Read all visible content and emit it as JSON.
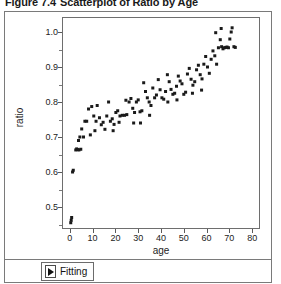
{
  "caption": {
    "number": "Figure 7.4",
    "text": "Scatterplot of Ratio by Age"
  },
  "bottom_bar": {
    "fitting_label": "Fitting",
    "expander_icon": "triangle-right-icon"
  },
  "chart_data": {
    "type": "scatter",
    "title": "Scatterplot of Ratio by Age",
    "xlabel": "age",
    "ylabel": "ratio",
    "xlim": [
      -3,
      83
    ],
    "ylim": [
      0.44,
      1.04
    ],
    "xticks": [
      0,
      10,
      20,
      30,
      40,
      50,
      60,
      70,
      80
    ],
    "xtick_labels": [
      "0",
      "10",
      "20",
      "30",
      "40",
      "50",
      "60",
      "70",
      "80"
    ],
    "yticks": [
      0.5,
      0.6,
      0.7,
      0.8,
      0.9,
      1.0
    ],
    "ytick_labels": [
      "0.5",
      "0.6",
      "0.7",
      "0.8",
      "0.9",
      "1.0"
    ],
    "grid": false,
    "legend": false,
    "marker": "square",
    "marker_color": "#1a1a1a",
    "marker_size": 3,
    "points": [
      [
        0.4,
        0.455
      ],
      [
        0.6,
        0.462
      ],
      [
        0.8,
        0.47
      ],
      [
        1.2,
        0.6
      ],
      [
        1.5,
        0.605
      ],
      [
        2.6,
        0.663
      ],
      [
        3.0,
        0.666
      ],
      [
        3.4,
        0.664
      ],
      [
        3.8,
        0.69
      ],
      [
        4.4,
        0.7
      ],
      [
        5.2,
        0.723
      ],
      [
        6.6,
        0.745
      ],
      [
        8.2,
        0.78
      ],
      [
        9.6,
        0.787
      ],
      [
        4.0,
        0.663
      ],
      [
        4.8,
        0.665
      ],
      [
        10.5,
        0.76
      ],
      [
        11.5,
        0.745
      ],
      [
        12.0,
        0.79
      ],
      [
        13.0,
        0.755
      ],
      [
        13.8,
        0.735
      ],
      [
        14.6,
        0.742
      ],
      [
        15.4,
        0.722
      ],
      [
        16.2,
        0.76
      ],
      [
        17.0,
        0.8
      ],
      [
        17.8,
        0.745
      ],
      [
        18.6,
        0.752
      ],
      [
        19.4,
        0.736
      ],
      [
        20.2,
        0.77
      ],
      [
        21.0,
        0.775
      ],
      [
        22.0,
        0.76
      ],
      [
        23.0,
        0.762
      ],
      [
        24.0,
        0.762
      ],
      [
        25.0,
        0.764
      ],
      [
        26.0,
        0.8
      ],
      [
        26.8,
        0.81
      ],
      [
        27.6,
        0.782
      ],
      [
        28.4,
        0.77
      ],
      [
        29.2,
        0.8
      ],
      [
        30.0,
        0.806
      ],
      [
        30.8,
        0.772
      ],
      [
        31.6,
        0.775
      ],
      [
        32.4,
        0.855
      ],
      [
        33.2,
        0.83
      ],
      [
        34.0,
        0.812
      ],
      [
        34.8,
        0.8
      ],
      [
        35.6,
        0.79
      ],
      [
        36.4,
        0.84
      ],
      [
        37.2,
        0.812
      ],
      [
        38.0,
        0.82
      ],
      [
        38.8,
        0.864
      ],
      [
        39.6,
        0.835
      ],
      [
        40.4,
        0.812
      ],
      [
        41.2,
        0.808
      ],
      [
        42.0,
        0.83
      ],
      [
        42.8,
        0.878
      ],
      [
        43.6,
        0.858
      ],
      [
        44.4,
        0.836
      ],
      [
        45.2,
        0.822
      ],
      [
        46.0,
        0.825
      ],
      [
        46.8,
        0.845
      ],
      [
        47.6,
        0.874
      ],
      [
        48.4,
        0.86
      ],
      [
        49.2,
        0.852
      ],
      [
        50.0,
        0.822
      ],
      [
        50.8,
        0.828
      ],
      [
        51.6,
        0.88
      ],
      [
        52.4,
        0.896
      ],
      [
        53.2,
        0.865
      ],
      [
        54.0,
        0.848
      ],
      [
        54.8,
        0.858
      ],
      [
        55.6,
        0.892
      ],
      [
        56.4,
        0.905
      ],
      [
        57.2,
        0.878
      ],
      [
        58.0,
        0.866
      ],
      [
        58.8,
        0.908
      ],
      [
        59.6,
        0.93
      ],
      [
        60.4,
        0.9
      ],
      [
        61.2,
        0.882
      ],
      [
        62.0,
        0.922
      ],
      [
        62.8,
        0.946
      ],
      [
        63.6,
        0.932
      ],
      [
        64.4,
        0.908
      ],
      [
        65.2,
        0.955
      ],
      [
        66.0,
        0.978
      ],
      [
        66.6,
        0.958
      ],
      [
        67.2,
        0.952
      ],
      [
        67.8,
        0.955
      ],
      [
        68.4,
        0.956
      ],
      [
        69.0,
        0.957
      ],
      [
        69.6,
        0.955
      ],
      [
        70.2,
        0.98
      ],
      [
        70.8,
        1.0
      ],
      [
        71.2,
        1.012
      ],
      [
        66.4,
        1.01
      ],
      [
        64.0,
        0.998
      ],
      [
        72.0,
        0.958
      ],
      [
        72.6,
        0.956
      ],
      [
        24.6,
        0.805
      ],
      [
        28.0,
        0.74
      ],
      [
        21.6,
        0.742
      ],
      [
        19.0,
        0.718
      ],
      [
        7.4,
        0.745
      ],
      [
        6.0,
        0.7
      ],
      [
        11.0,
        0.718
      ],
      [
        9.0,
        0.706
      ],
      [
        43.0,
        0.8
      ],
      [
        47.0,
        0.806
      ],
      [
        53.8,
        0.825
      ],
      [
        57.8,
        0.834
      ],
      [
        35.0,
        0.762
      ],
      [
        31.0,
        0.74
      ]
    ]
  }
}
